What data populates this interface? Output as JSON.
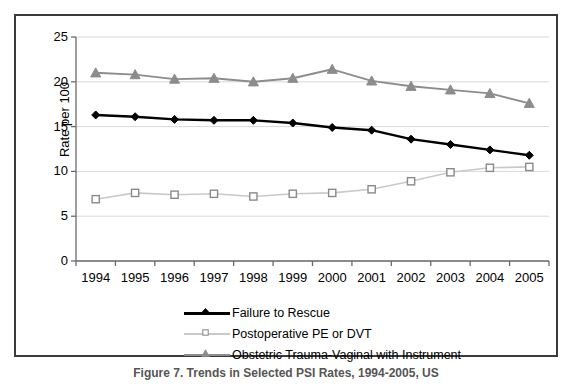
{
  "figure": {
    "caption": "Figure 7. Trends in Selected PSI Rates, 1994-2005, US"
  },
  "chart_data": {
    "type": "line",
    "title": "",
    "xlabel": "",
    "ylabel": "Rate per 100",
    "categories": [
      "1994",
      "1995",
      "1996",
      "1997",
      "1998",
      "1999",
      "2000",
      "2001",
      "2002",
      "2003",
      "2004",
      "2005"
    ],
    "ylim": [
      0,
      25
    ],
    "yticks": [
      0,
      5,
      10,
      15,
      20,
      25
    ],
    "grid": "horizontal",
    "legend_position": "bottom",
    "series": [
      {
        "name": "Failure to Rescue",
        "color": "#000000",
        "marker": "diamond",
        "values": [
          16.3,
          16.1,
          15.8,
          15.7,
          15.7,
          15.4,
          14.9,
          14.6,
          13.6,
          13.0,
          12.4,
          11.8
        ]
      },
      {
        "name": "Postoperative PE or DVT",
        "color": "#c9c9c9",
        "marker": "square",
        "values": [
          6.9,
          7.6,
          7.4,
          7.5,
          7.2,
          7.5,
          7.6,
          8.0,
          8.9,
          9.9,
          10.4,
          10.5
        ]
      },
      {
        "name": "Obstetric Trauma-Vaginal with Instrument",
        "color": "#8c8c8c",
        "marker": "triangle",
        "values": [
          21.0,
          20.8,
          20.3,
          20.4,
          20.0,
          20.4,
          21.4,
          20.1,
          19.5,
          19.1,
          18.7,
          17.6
        ]
      }
    ]
  },
  "axis": {
    "y_tick_labels": [
      "25",
      "20",
      "15",
      "10",
      "5",
      "0"
    ],
    "y_axis_title": "Rate per 100"
  },
  "legend": {
    "items": [
      {
        "label": "Failure to Rescue",
        "color": "#000000",
        "marker": "diamond"
      },
      {
        "label": "Postoperative PE or DVT",
        "color": "#c9c9c9",
        "marker": "square"
      },
      {
        "label": "Obstetric Trauma-Vaginal with Instrument",
        "color": "#8c8c8c",
        "marker": "triangle"
      }
    ]
  }
}
